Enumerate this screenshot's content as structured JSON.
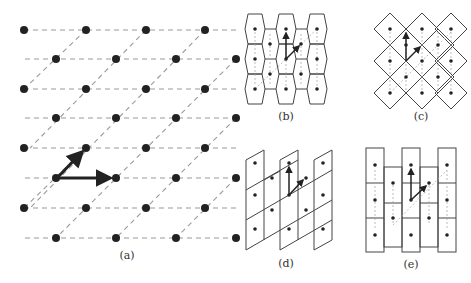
{
  "figure": {
    "panels": [
      {
        "id": "a",
        "label": "(a)",
        "description": "Oblique 2D lattice with two primitive basis vectors"
      },
      {
        "id": "b",
        "label": "(b)",
        "description": "Lattice tiled with hexagonal (Wigner-Seitz) cells"
      },
      {
        "id": "c",
        "label": "(c)",
        "description": "Lattice tiled with square (diamond) cells"
      },
      {
        "id": "d",
        "label": "(d)",
        "description": "Lattice tiled with parallelogram cells"
      },
      {
        "id": "e",
        "label": "(e)",
        "description": "Lattice tiled with rectangular cells in offset columns"
      }
    ],
    "colors": {
      "dot": "#222222",
      "arrow": "#222222",
      "dashed_line": "#9a9a9a",
      "cell_outline": "#444444",
      "background": "#ffffff"
    }
  }
}
